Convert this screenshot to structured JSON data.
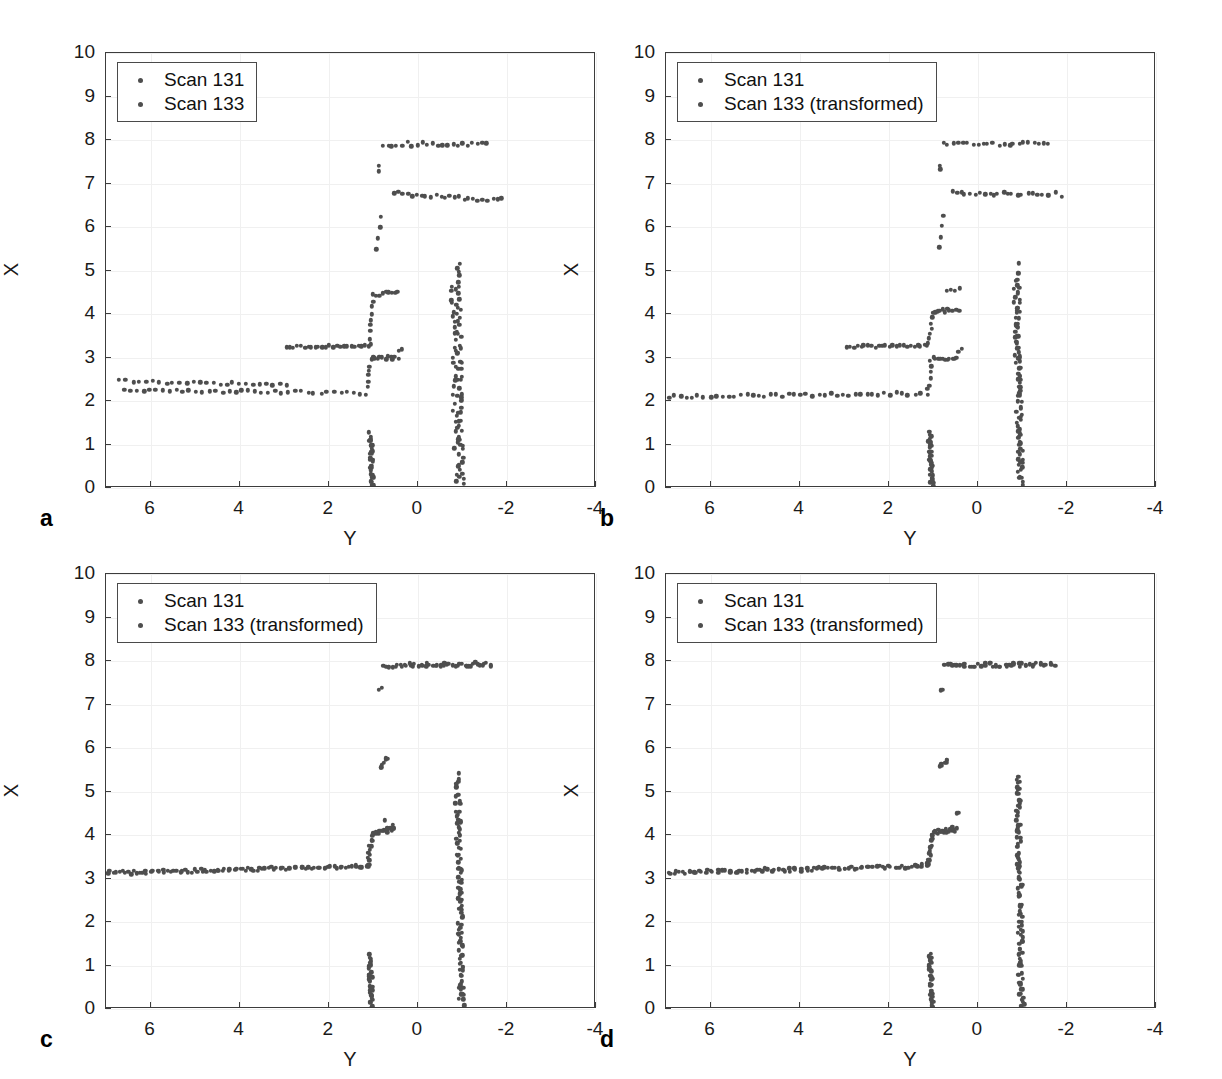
{
  "figure": {
    "background": "#ffffff",
    "point_color": "#4e4e4e",
    "axis_color": "#3c3c3c",
    "grid_color": "#f0f0f0"
  },
  "axes": {
    "xlabel": "Y",
    "ylabel": "X",
    "xlim": [
      7,
      -4
    ],
    "ylim": [
      0,
      10
    ],
    "xticks": [
      6,
      4,
      2,
      0,
      -2,
      -4
    ],
    "xticklabels": [
      "6",
      "4",
      "2",
      "0",
      "-2",
      "-4"
    ],
    "yticks": [
      0,
      1,
      2,
      3,
      4,
      5,
      6,
      7,
      8,
      9,
      10
    ],
    "yticklabels": [
      "0",
      "1",
      "2",
      "3",
      "4",
      "5",
      "6",
      "7",
      "8",
      "9",
      "10"
    ],
    "grid": true
  },
  "panels": [
    {
      "label": "a",
      "legend": [
        "Scan 131",
        "Scan 133"
      ],
      "caption_note": "unregistered scans"
    },
    {
      "label": "b",
      "legend": [
        "Scan 131",
        "Scan 133 (transformed)"
      ],
      "caption_note": "partially registered"
    },
    {
      "label": "c",
      "legend": [
        "Scan 131",
        "Scan 133 (transformed)"
      ],
      "caption_note": "registered"
    },
    {
      "label": "d",
      "legend": [
        "Scan 131",
        "Scan 133 (transformed)"
      ],
      "caption_note": "registered"
    }
  ],
  "chart_data": {
    "type": "scatter",
    "title": "",
    "xlabel": "Y",
    "ylabel": "X",
    "xlim": [
      7,
      -4
    ],
    "ylim": [
      0,
      10
    ],
    "grid": true,
    "legend_position": "upper-left",
    "marker": "dot",
    "panels": [
      {
        "id": "a",
        "series": [
          {
            "name": "Scan 131",
            "segments": [
              {
                "comment": "near wall left, x~2.45",
                "y_from": 6.7,
                "y_to": 2.95,
                "x_from": 2.46,
                "x_to": 2.36,
                "n": 26,
                "jitter": 0.035
              },
              {
                "comment": "mid wall, x~3.25",
                "y_from": 2.95,
                "y_to": 1.1,
                "x_from": 3.24,
                "x_to": 3.27,
                "n": 24,
                "jitter": 0.03
              },
              {
                "comment": "riser up at y~1.05",
                "y_from": 1.08,
                "y_to": 1.0,
                "x_from": 3.3,
                "x_to": 4.45,
                "n": 9,
                "jitter": 0.03
              },
              {
                "comment": "upper ledge 4.45",
                "y_from": 0.95,
                "y_to": 0.45,
                "x_from": 4.45,
                "x_to": 4.52,
                "n": 8,
                "jitter": 0.04
              },
              {
                "comment": "jump to 5.5-6.2",
                "y_from": 0.9,
                "y_to": 0.85,
                "x_from": 5.5,
                "x_to": 6.25,
                "n": 4,
                "jitter": 0.05
              },
              {
                "comment": "tall jump 7.35",
                "y_from": 0.88,
                "y_to": 0.86,
                "x_from": 7.3,
                "x_to": 7.4,
                "n": 2,
                "jitter": 0.03
              },
              {
                "comment": "top shelf 7.9",
                "y_from": 0.8,
                "y_to": -1.55,
                "x_from": 7.9,
                "x_to": 7.92,
                "n": 22,
                "jitter": 0.05
              },
              {
                "comment": "long shelf 6.75",
                "y_from": 0.55,
                "y_to": -1.9,
                "x_from": 6.78,
                "x_to": 6.62,
                "n": 24,
                "jitter": 0.05
              },
              {
                "comment": "vertical ray at y~1.05",
                "y_from": 1.06,
                "y_to": 1.02,
                "x_from": 1.25,
                "x_to": 0.0,
                "n": 34,
                "jitter": 0.05
              },
              {
                "comment": "vertical ray at y~-0.95",
                "y_from": -0.9,
                "y_to": -0.98,
                "x_from": 5.1,
                "x_to": 0.0,
                "n": 56,
                "jitter": 0.07
              }
            ]
          },
          {
            "name": "Scan 133",
            "segments": [
              {
                "comment": "near wall x~2.2",
                "y_from": 6.6,
                "y_to": 1.15,
                "x_from": 2.25,
                "x_to": 2.18,
                "n": 38,
                "jitter": 0.035
              },
              {
                "comment": "riser",
                "y_from": 1.12,
                "y_to": 1.05,
                "x_from": 2.3,
                "x_to": 2.95,
                "n": 6,
                "jitter": 0.04
              },
              {
                "comment": "ledge 2.98",
                "y_from": 1.0,
                "y_to": 0.45,
                "x_from": 2.98,
                "x_to": 3.0,
                "n": 11,
                "jitter": 0.04
              },
              {
                "comment": "step 3.15",
                "y_from": 0.4,
                "y_to": 0.35,
                "x_from": 3.15,
                "x_to": 3.18,
                "n": 2,
                "jitter": 0.03
              },
              {
                "comment": "ray cluster y~-0.85",
                "y_from": -0.78,
                "y_to": -0.88,
                "x_from": 4.6,
                "x_to": 0.2,
                "n": 34,
                "jitter": 0.07
              }
            ]
          }
        ]
      },
      {
        "id": "b",
        "series": [
          {
            "name": "Scan 131",
            "segments": [
              {
                "comment": "wall 3.25",
                "y_from": 2.95,
                "y_to": 1.12,
                "x_from": 3.24,
                "x_to": 3.27,
                "n": 24,
                "jitter": 0.03
              },
              {
                "comment": "riser",
                "y_from": 1.1,
                "y_to": 1.0,
                "x_from": 3.3,
                "x_to": 4.05,
                "n": 7,
                "jitter": 0.03
              },
              {
                "comment": "ledge 4.05",
                "y_from": 0.95,
                "y_to": 0.45,
                "x_from": 4.06,
                "x_to": 4.1,
                "n": 10,
                "jitter": 0.04
              },
              {
                "comment": "step 4.5",
                "y_from": 0.72,
                "y_to": 0.42,
                "x_from": 4.5,
                "x_to": 4.58,
                "n": 4,
                "jitter": 0.04
              },
              {
                "comment": "5.5-6.2",
                "y_from": 0.85,
                "y_to": 0.8,
                "x_from": 5.55,
                "x_to": 6.25,
                "n": 4,
                "jitter": 0.05
              },
              {
                "comment": "7.35",
                "y_from": 0.85,
                "y_to": 0.83,
                "x_from": 7.32,
                "x_to": 7.38,
                "n": 2,
                "jitter": 0.03
              },
              {
                "comment": "top shelf 7.9",
                "y_from": 0.78,
                "y_to": -1.6,
                "x_from": 7.9,
                "x_to": 7.92,
                "n": 22,
                "jitter": 0.05
              },
              {
                "comment": "shelf 6.78",
                "y_from": 0.6,
                "y_to": -1.85,
                "x_from": 6.78,
                "x_to": 6.75,
                "n": 24,
                "jitter": 0.05
              },
              {
                "comment": "ray y~1.07",
                "y_from": 1.08,
                "y_to": 1.03,
                "x_from": 1.25,
                "x_to": 0.0,
                "n": 34,
                "jitter": 0.05
              },
              {
                "comment": "ray y~-0.93",
                "y_from": -0.9,
                "y_to": -0.97,
                "x_from": 5.1,
                "x_to": 0.0,
                "n": 56,
                "jitter": 0.07
              }
            ]
          },
          {
            "name": "Scan 133 (transformed)",
            "segments": [
              {
                "comment": "floor wall 2.15",
                "y_from": 6.95,
                "y_to": 1.15,
                "x_from": 2.1,
                "x_to": 2.17,
                "n": 44,
                "jitter": 0.035
              },
              {
                "comment": "riser",
                "y_from": 1.12,
                "y_to": 1.05,
                "x_from": 2.25,
                "x_to": 2.9,
                "n": 6,
                "jitter": 0.04
              },
              {
                "comment": "ledge 2.98",
                "y_from": 1.0,
                "y_to": 0.45,
                "x_from": 2.97,
                "x_to": 3.0,
                "n": 11,
                "jitter": 0.04
              },
              {
                "comment": "step 3.15",
                "y_from": 0.42,
                "y_to": 0.38,
                "x_from": 3.15,
                "x_to": 3.18,
                "n": 2,
                "jitter": 0.03
              },
              {
                "comment": "ray y~-0.9",
                "y_from": -0.85,
                "y_to": -0.95,
                "x_from": 4.65,
                "x_to": 0.1,
                "n": 38,
                "jitter": 0.07
              }
            ]
          }
        ]
      },
      {
        "id": "c",
        "series": [
          {
            "name": "Scan 131",
            "segments": [
              {
                "comment": "long floor 3.2",
                "y_from": 6.95,
                "y_to": 1.12,
                "x_from": 3.12,
                "x_to": 3.27,
                "n": 48,
                "jitter": 0.035
              },
              {
                "comment": "riser",
                "y_from": 1.1,
                "y_to": 1.02,
                "x_from": 3.3,
                "x_to": 4.0,
                "n": 7,
                "jitter": 0.03
              },
              {
                "comment": "ledge 4.05",
                "y_from": 0.97,
                "y_to": 0.55,
                "x_from": 4.04,
                "x_to": 4.12,
                "n": 9,
                "jitter": 0.04
              },
              {
                "comment": "point 4.35",
                "y_from": 0.75,
                "y_to": 0.58,
                "x_from": 4.35,
                "x_to": 4.2,
                "n": 2,
                "jitter": 0.04
              },
              {
                "comment": "5.55-5.75",
                "y_from": 0.85,
                "y_to": 0.7,
                "x_from": 5.55,
                "x_to": 5.75,
                "n": 4,
                "jitter": 0.04
              },
              {
                "comment": "7.35",
                "y_from": 0.85,
                "y_to": 0.8,
                "x_from": 7.33,
                "x_to": 7.36,
                "n": 2,
                "jitter": 0.03
              },
              {
                "comment": "top shelf 7.9",
                "y_from": 0.75,
                "y_to": -1.65,
                "x_from": 7.89,
                "x_to": 7.92,
                "n": 26,
                "jitter": 0.05
              },
              {
                "comment": "ray y~1.07",
                "y_from": 1.08,
                "y_to": 1.03,
                "x_from": 1.25,
                "x_to": 0.0,
                "n": 34,
                "jitter": 0.05
              },
              {
                "comment": "ray y~-0.93",
                "y_from": -0.88,
                "y_to": -0.98,
                "x_from": 5.35,
                "x_to": 0.0,
                "n": 58,
                "jitter": 0.07
              }
            ]
          },
          {
            "name": "Scan 133 (transformed)",
            "segments": [
              {
                "comment": "long floor 3.2 overlay",
                "y_from": 6.9,
                "y_to": 1.15,
                "x_from": 3.14,
                "x_to": 3.28,
                "n": 44,
                "jitter": 0.04
              },
              {
                "comment": "riser",
                "y_from": 1.12,
                "y_to": 1.04,
                "x_from": 3.32,
                "x_to": 4.02,
                "n": 6,
                "jitter": 0.03
              },
              {
                "comment": "ledge 4.08",
                "y_from": 0.98,
                "y_to": 0.55,
                "x_from": 4.06,
                "x_to": 4.14,
                "n": 8,
                "jitter": 0.04
              },
              {
                "comment": "5.6",
                "y_from": 0.84,
                "y_to": 0.72,
                "x_from": 5.57,
                "x_to": 5.72,
                "n": 3,
                "jitter": 0.04
              },
              {
                "comment": "top shelf overlay",
                "y_from": 0.72,
                "y_to": -1.6,
                "x_from": 7.9,
                "x_to": 7.93,
                "n": 22,
                "jitter": 0.05
              },
              {
                "comment": "ray y~-0.95",
                "y_from": -0.9,
                "y_to": -1.0,
                "x_from": 5.2,
                "x_to": 0.05,
                "n": 44,
                "jitter": 0.07
              }
            ]
          }
        ]
      },
      {
        "id": "d",
        "series": [
          {
            "name": "Scan 131",
            "segments": [
              {
                "comment": "long floor 3.2",
                "y_from": 6.95,
                "y_to": 1.12,
                "x_from": 3.12,
                "x_to": 3.28,
                "n": 48,
                "jitter": 0.035
              },
              {
                "comment": "riser",
                "y_from": 1.1,
                "y_to": 1.02,
                "x_from": 3.3,
                "x_to": 4.0,
                "n": 7,
                "jitter": 0.03
              },
              {
                "comment": "ledge 4.05",
                "y_from": 0.97,
                "y_to": 0.5,
                "x_from": 4.04,
                "x_to": 4.12,
                "n": 10,
                "jitter": 0.04
              },
              {
                "comment": "point 4.5",
                "y_from": 0.5,
                "y_to": 0.45,
                "x_from": 4.5,
                "x_to": 4.48,
                "n": 2,
                "jitter": 0.03
              },
              {
                "comment": "5.55-5.75",
                "y_from": 0.85,
                "y_to": 0.68,
                "x_from": 5.55,
                "x_to": 5.75,
                "n": 4,
                "jitter": 0.04
              },
              {
                "comment": "7.35",
                "y_from": 0.85,
                "y_to": 0.8,
                "x_from": 7.33,
                "x_to": 7.36,
                "n": 2,
                "jitter": 0.03
              },
              {
                "comment": "top shelf 7.9",
                "y_from": 0.75,
                "y_to": -1.7,
                "x_from": 7.89,
                "x_to": 7.92,
                "n": 26,
                "jitter": 0.05
              },
              {
                "comment": "ray y~1.07",
                "y_from": 1.08,
                "y_to": 1.03,
                "x_from": 1.25,
                "x_to": 0.0,
                "n": 34,
                "jitter": 0.05
              },
              {
                "comment": "ray y~-0.93",
                "y_from": -0.88,
                "y_to": -0.98,
                "x_from": 5.35,
                "x_to": 0.0,
                "n": 58,
                "jitter": 0.07
              }
            ]
          },
          {
            "name": "Scan 133 (transformed)",
            "segments": [
              {
                "comment": "long floor overlay",
                "y_from": 6.9,
                "y_to": 1.15,
                "x_from": 3.14,
                "x_to": 3.29,
                "n": 44,
                "jitter": 0.04
              },
              {
                "comment": "riser",
                "y_from": 1.12,
                "y_to": 1.04,
                "x_from": 3.32,
                "x_to": 4.03,
                "n": 6,
                "jitter": 0.03
              },
              {
                "comment": "ledge 4.08",
                "y_from": 0.98,
                "y_to": 0.52,
                "x_from": 4.06,
                "x_to": 4.15,
                "n": 9,
                "jitter": 0.04
              },
              {
                "comment": "5.6",
                "y_from": 0.84,
                "y_to": 0.7,
                "x_from": 5.57,
                "x_to": 5.73,
                "n": 3,
                "jitter": 0.04
              },
              {
                "comment": "top shelf overlay",
                "y_from": 0.72,
                "y_to": -1.62,
                "x_from": 7.9,
                "x_to": 7.93,
                "n": 22,
                "jitter": 0.05
              },
              {
                "comment": "ray y~-0.95",
                "y_from": -0.9,
                "y_to": -1.0,
                "x_from": 5.2,
                "x_to": 0.05,
                "n": 46,
                "jitter": 0.07
              }
            ]
          }
        ]
      }
    ]
  }
}
